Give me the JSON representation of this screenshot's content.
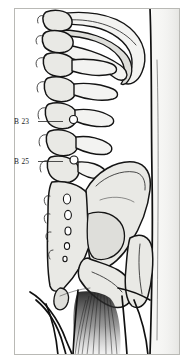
{
  "figure": {
    "frame": {
      "present": true,
      "color": "#b9b9b5"
    },
    "colors": {
      "background": "#ffffff",
      "bone_fill": "#e9e9e5",
      "bone_fill_light": "#f3f3f1",
      "bone_fill_mid": "#dededa",
      "outline": "#141414",
      "skin_tone": "#f6f6f4",
      "label_text": "#1b1b1b",
      "leader_line": "#232323"
    },
    "labels": [
      {
        "id": "label-b23",
        "text": "B 23",
        "x": 14,
        "y": 124,
        "leader": {
          "from_x": 38,
          "to_x": 63,
          "y": 121.5
        },
        "target": "lumbar vertebra L2 level"
      },
      {
        "id": "label-b25",
        "text": "B 25",
        "x": 14,
        "y": 164,
        "leader": {
          "from_x": 38,
          "to_x": 63,
          "y": 161.5
        },
        "target": "lumbar vertebra L4 level"
      }
    ],
    "anatomy": [
      {
        "name": "thoracic-vertebrae",
        "description": "stacked vertebral bodies with spinous processes, upper left"
      },
      {
        "name": "rib-arc",
        "description": "large curved rib sweeping to the right across the top"
      },
      {
        "name": "transverse-processes",
        "description": "lateral projections from lumbar vertebrae"
      },
      {
        "name": "lumbar-vertebrae",
        "description": "five lumbar vertebrae in lateral profile"
      },
      {
        "name": "sacrum",
        "description": "triangular sacral bone with sacral foramina"
      },
      {
        "name": "ilium",
        "description": "large iliac wing / iliac crest of the pelvis"
      },
      {
        "name": "ischium",
        "description": "lower posterior pelvic bone"
      },
      {
        "name": "femur-trochanter",
        "description": "greater trochanter and proximal femur, right side"
      },
      {
        "name": "body-contour",
        "description": "vertical skin outline of the back and flank"
      },
      {
        "name": "gluteal-muscle-fibers",
        "description": "fanned muscle fiber striations at the bottom center"
      }
    ]
  }
}
